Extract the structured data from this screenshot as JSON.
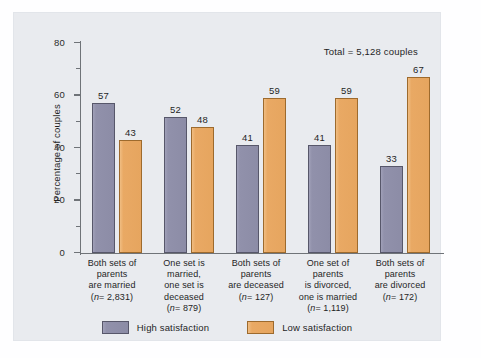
{
  "chart_data": {
    "type": "bar",
    "title": "",
    "subtitle": "",
    "xlabel": "",
    "ylabel": "Percentage of couples",
    "ylim": [
      0,
      80
    ],
    "ytick_labels": [
      "0",
      "20",
      "40",
      "60",
      "80"
    ],
    "ytick_values": [
      0,
      20,
      40,
      60,
      80
    ],
    "minor_tick_values": [
      10,
      30,
      50,
      70
    ],
    "grid": false,
    "legend_position": "bottom-center",
    "annotation": "Total = 5,128 couples",
    "categories": [
      "Both sets of parents are married (n = 2,831)",
      "One set is married, one set is deceased (n = 879)",
      "Both sets of parents are deceased (n = 127)",
      "One set of parents is divorced, one is married (n = 1,119)",
      "Both sets of parents are divorced (n = 172)"
    ],
    "category_lines": [
      [
        "Both sets of",
        "parents",
        "are married",
        "(n = 2,831)"
      ],
      [
        "One set is",
        "married,",
        "one set is",
        "deceased",
        "(n = 879)"
      ],
      [
        "Both sets of",
        "parents",
        "are deceased",
        "(n = 127)"
      ],
      [
        "One set of",
        "parents",
        "is divorced,",
        "one is married",
        "(n = 1,119)"
      ],
      [
        "Both sets of",
        "parents",
        "are divorced",
        "(n = 172)"
      ]
    ],
    "series": [
      {
        "name": "High satisfaction",
        "color": "#8c8ca6",
        "values": [
          57,
          52,
          41,
          41,
          33
        ]
      },
      {
        "name": "Low satisfaction",
        "color": "#e6a55f",
        "values": [
          43,
          48,
          59,
          59,
          67
        ]
      }
    ]
  },
  "colors": {
    "panel_background": "#e9ebef",
    "page_background": "#fefeff",
    "axis": "#6f7378",
    "text": "#1f1f1f",
    "high_satisfaction": "#8c8ca6",
    "low_satisfaction": "#e6a55f"
  }
}
